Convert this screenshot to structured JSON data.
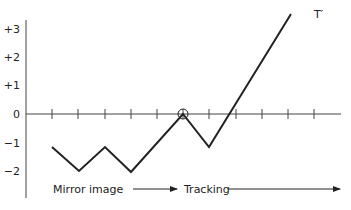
{
  "y_ticks": [
    {
      "label": "+3",
      "y": 29
    },
    {
      "label": "+2",
      "y": 57
    },
    {
      "label": "+1",
      "y": 85
    },
    {
      "label": "0",
      "y": 114
    },
    {
      "label": "−1",
      "y": 143
    },
    {
      "label": "−2",
      "y": 171
    }
  ],
  "x_tick_positions": [
    52,
    78,
    105,
    131,
    157,
    183,
    209,
    236,
    262,
    288,
    314
  ],
  "trace_points": "52,147 79,171 105,147 131,172 183,114 209,147 291,14",
  "circle_point": {
    "x": 183,
    "y": 114
  },
  "end_label": "T′",
  "phase_labels": {
    "mirror": "Mirror image",
    "tracking": "Tracking"
  },
  "colors": {
    "line": "#222222",
    "axis": "#444444"
  }
}
